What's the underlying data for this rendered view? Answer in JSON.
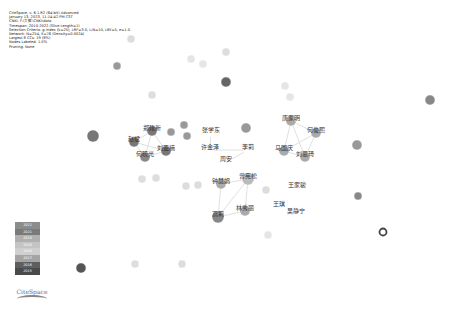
{
  "header": {
    "lines": [
      "CiteSpace, v. 6.1.R2 (64-bit) Advanced",
      "January 13, 2023, 11:14:42 PM CST",
      "CNKI: F:\\文献\\CNKI\\data",
      "Timespan: 2010-2022 (Slice Length=1)",
      "Selection Criteria: g-index (k=25), LRF=3.0, L/N=10, LBY=5, e=1.0",
      "Network: N=254, E=76 (Density=0.0024)",
      "Largest 8 CCs: 19 (8%)",
      "Nodes Labeled: 1.0%",
      "Pruning: None"
    ]
  },
  "legend": {
    "years": [
      "2022",
      "2021",
      "2020",
      "2019",
      "2018",
      "2017",
      "2016",
      "2015"
    ],
    "colors": [
      "#8c8c8c",
      "#7a7a7a",
      "#b0b0b0",
      "#c4c4c4",
      "#cfcfcf",
      "#a4a4a4",
      "#5e5e5e",
      "#4a4a4a"
    ]
  },
  "logo": {
    "text": "CiteSpace"
  },
  "nodes": [
    {
      "x": 152,
      "y": 131,
      "r": 5,
      "color": "#777",
      "label": "郑建新"
    },
    {
      "x": 134,
      "y": 142,
      "r": 5,
      "color": "#777",
      "label": "赵斌"
    },
    {
      "x": 145,
      "y": 157,
      "r": 5,
      "color": "#888",
      "label": "何晓光"
    },
    {
      "x": 166,
      "y": 151,
      "r": 5,
      "color": "#777",
      "label": "刘亚楠"
    },
    {
      "x": 211,
      "y": 133,
      "r": 4,
      "color": "#fff",
      "label": "张学东"
    },
    {
      "x": 210,
      "y": 150,
      "r": 3,
      "color": "#fff",
      "label": "许金泽"
    },
    {
      "x": 248,
      "y": 150,
      "r": 5,
      "color": "#fff",
      "label": "李莉"
    },
    {
      "x": 226,
      "y": 162,
      "r": 2,
      "color": "#fff",
      "label": "周安"
    },
    {
      "x": 291,
      "y": 121,
      "r": 5,
      "color": "#aaa",
      "label": "唐家明"
    },
    {
      "x": 316,
      "y": 133,
      "r": 5,
      "color": "#aaa",
      "label": "何俊熙"
    },
    {
      "x": 284,
      "y": 151,
      "r": 5,
      "color": "#aaa",
      "label": "马国庆"
    },
    {
      "x": 305,
      "y": 157,
      "r": 5,
      "color": "#aaa",
      "label": "刘思琦"
    },
    {
      "x": 248,
      "y": 179,
      "r": 6,
      "color": "#bbb",
      "label": "曾宪松"
    },
    {
      "x": 221,
      "y": 184,
      "r": 5,
      "color": "#aaa",
      "label": "钟慧娟"
    },
    {
      "x": 245,
      "y": 211,
      "r": 5,
      "color": "#aaa",
      "label": "林秀丽"
    },
    {
      "x": 218,
      "y": 217,
      "r": 6,
      "color": "#888",
      "label": "高莉"
    },
    {
      "x": 297,
      "y": 188,
      "r": 3,
      "color": "#fff",
      "label": "王家骏"
    },
    {
      "x": 279,
      "y": 207,
      "r": 3,
      "color": "#fff",
      "label": "王琪"
    },
    {
      "x": 296,
      "y": 214,
      "r": 3,
      "color": "#fff",
      "label": "吴静宁"
    },
    {
      "x": 93,
      "y": 136,
      "r": 6,
      "color": "#777",
      "label": ""
    },
    {
      "x": 171,
      "y": 132,
      "r": 4,
      "color": "#999",
      "label": ""
    },
    {
      "x": 184,
      "y": 125,
      "r": 4,
      "color": "#999",
      "label": ""
    },
    {
      "x": 187,
      "y": 136,
      "r": 4,
      "color": "#999",
      "label": ""
    },
    {
      "x": 131,
      "y": 39,
      "r": 4,
      "color": "#ddd",
      "label": ""
    },
    {
      "x": 117,
      "y": 66,
      "r": 4,
      "color": "#999",
      "label": ""
    },
    {
      "x": 152,
      "y": 95,
      "r": 4,
      "color": "#ddd",
      "label": ""
    },
    {
      "x": 191,
      "y": 59,
      "r": 4,
      "color": "#e5e5e5",
      "label": ""
    },
    {
      "x": 203,
      "y": 64,
      "r": 4,
      "color": "#e5e5e5",
      "label": ""
    },
    {
      "x": 226,
      "y": 52,
      "r": 4,
      "color": "#ddd",
      "label": ""
    },
    {
      "x": 226,
      "y": 82,
      "r": 5,
      "color": "#666",
      "label": ""
    },
    {
      "x": 285,
      "y": 86,
      "r": 4,
      "color": "#e5e5e5",
      "label": ""
    },
    {
      "x": 290,
      "y": 97,
      "r": 4,
      "color": "#e5e5e5",
      "label": ""
    },
    {
      "x": 430,
      "y": 100,
      "r": 5,
      "color": "#888",
      "label": ""
    },
    {
      "x": 246,
      "y": 128,
      "r": 5,
      "color": "#999",
      "label": ""
    },
    {
      "x": 142,
      "y": 179,
      "r": 4,
      "color": "#ddd",
      "label": ""
    },
    {
      "x": 156,
      "y": 178,
      "r": 4,
      "color": "#ddd",
      "label": ""
    },
    {
      "x": 186,
      "y": 186,
      "r": 4,
      "color": "#ddd",
      "label": ""
    },
    {
      "x": 198,
      "y": 185,
      "r": 4,
      "color": "#ddd",
      "label": ""
    },
    {
      "x": 266,
      "y": 190,
      "r": 4,
      "color": "#ddd",
      "label": ""
    },
    {
      "x": 357,
      "y": 145,
      "r": 5,
      "color": "#999",
      "label": ""
    },
    {
      "x": 358,
      "y": 196,
      "r": 4,
      "color": "#888",
      "label": ""
    },
    {
      "x": 268,
      "y": 235,
      "r": 4,
      "color": "#e5e5e5",
      "label": ""
    },
    {
      "x": 81,
      "y": 268,
      "r": 5,
      "color": "#555",
      "label": ""
    },
    {
      "x": 135,
      "y": 264,
      "r": 4,
      "color": "#ddd",
      "label": ""
    },
    {
      "x": 182,
      "y": 264,
      "r": 4,
      "color": "#ddd",
      "label": ""
    },
    {
      "x": 383,
      "y": 232,
      "r": 3.5,
      "color": "#444",
      "label": "",
      "ring": true
    }
  ],
  "edges": [
    [
      0,
      1
    ],
    [
      0,
      2
    ],
    [
      0,
      3
    ],
    [
      1,
      2
    ],
    [
      1,
      3
    ],
    [
      2,
      3
    ],
    [
      4,
      5
    ],
    [
      5,
      6
    ],
    [
      6,
      7
    ],
    [
      8,
      9
    ],
    [
      8,
      10
    ],
    [
      8,
      11
    ],
    [
      9,
      11
    ],
    [
      10,
      11
    ],
    [
      9,
      10
    ],
    [
      12,
      13
    ],
    [
      12,
      14
    ],
    [
      12,
      15
    ],
    [
      13,
      15
    ],
    [
      14,
      15
    ]
  ]
}
